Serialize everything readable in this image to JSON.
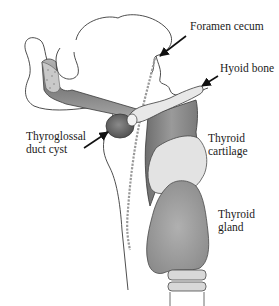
{
  "figure": {
    "labels": {
      "foramen_cecum": {
        "lines": [
          "Foramen cecum"
        ]
      },
      "hyoid_bone": {
        "lines": [
          "Hyoid bone"
        ]
      },
      "thyroglossal_duct_cyst": {
        "lines": [
          "Thyroglossal",
          "duct cyst"
        ]
      },
      "thyroid_cartilage": {
        "lines": [
          "Thyroid",
          "cartilage"
        ]
      },
      "thyroid_gland": {
        "lines": [
          "Thyroid",
          "gland"
        ]
      }
    },
    "colors": {
      "outline": "#3a3a3a",
      "background": "#ffffff",
      "muscle": "#8a8a8a",
      "cyst": "#6e6e6e",
      "cartilage": "#dcdcdc",
      "gland": "#9c9c9c",
      "trachea": "#d6d6d6",
      "duct_path": "#9a9a9a"
    }
  }
}
